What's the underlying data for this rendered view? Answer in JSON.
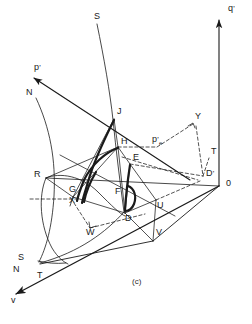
{
  "figure": {
    "caption": "(c)",
    "type": "3d-geometric-diagram",
    "background": "#ffffff",
    "stroke_color": "#1a1a1a",
    "width": 252,
    "height": 324
  },
  "axes": [
    {
      "id": "q-prime",
      "label": "q'",
      "label_x": 228,
      "label_y": 9,
      "direction": "up",
      "arrow": true
    },
    {
      "id": "p-prime",
      "label": "p'",
      "label_x": 36,
      "label_y": 68,
      "direction": "up-left",
      "arrow": true
    },
    {
      "id": "v",
      "label": "v",
      "label_x": 13,
      "label_y": 300,
      "direction": "down-left",
      "arrow": true
    }
  ],
  "points": [
    {
      "id": "S-top",
      "label": "S",
      "x": 95,
      "y": 17
    },
    {
      "id": "N-upper",
      "label": "N",
      "x": 28,
      "y": 93
    },
    {
      "id": "J",
      "label": "J",
      "x": 118,
      "y": 112
    },
    {
      "id": "Y",
      "label": "Y",
      "x": 196,
      "y": 117
    },
    {
      "id": "H",
      "label": "H",
      "x": 122,
      "y": 142
    },
    {
      "id": "pe-prime",
      "label": "p'e",
      "x": 154,
      "y": 140
    },
    {
      "id": "T-right",
      "label": "T",
      "x": 213,
      "y": 152
    },
    {
      "id": "E",
      "label": "E",
      "x": 134,
      "y": 158
    },
    {
      "id": "R",
      "label": "R",
      "x": 38,
      "y": 175
    },
    {
      "id": "D-prime",
      "label": "D'",
      "x": 209,
      "y": 174
    },
    {
      "id": "zero",
      "label": "0",
      "x": 227,
      "y": 184
    },
    {
      "id": "G",
      "label": "G",
      "x": 72,
      "y": 190
    },
    {
      "id": "F",
      "label": "F",
      "x": 117,
      "y": 192
    },
    {
      "id": "X",
      "label": "X",
      "x": 72,
      "y": 201
    },
    {
      "id": "U",
      "label": "U",
      "x": 159,
      "y": 206
    },
    {
      "id": "D",
      "label": "D",
      "x": 127,
      "y": 219
    },
    {
      "id": "W",
      "label": "W",
      "x": 88,
      "y": 232
    },
    {
      "id": "V",
      "label": "V",
      "x": 158,
      "y": 233
    },
    {
      "id": "S-lower",
      "label": "S",
      "x": 20,
      "y": 258
    },
    {
      "id": "N-lower",
      "label": "N",
      "x": 15,
      "y": 270
    },
    {
      "id": "T-lower",
      "label": "T",
      "x": 39,
      "y": 276
    }
  ]
}
